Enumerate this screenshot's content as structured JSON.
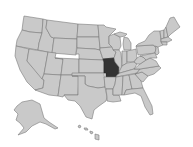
{
  "map": {
    "type": "us-states-locator",
    "highlighted_state": "Missouri",
    "colors": {
      "background": "#ffffff",
      "state_fill": "#c9c9c9",
      "state_border": "#7b7b7b",
      "highlight_fill": "#333333"
    },
    "insets": [
      "Alaska",
      "Hawaii"
    ]
  }
}
